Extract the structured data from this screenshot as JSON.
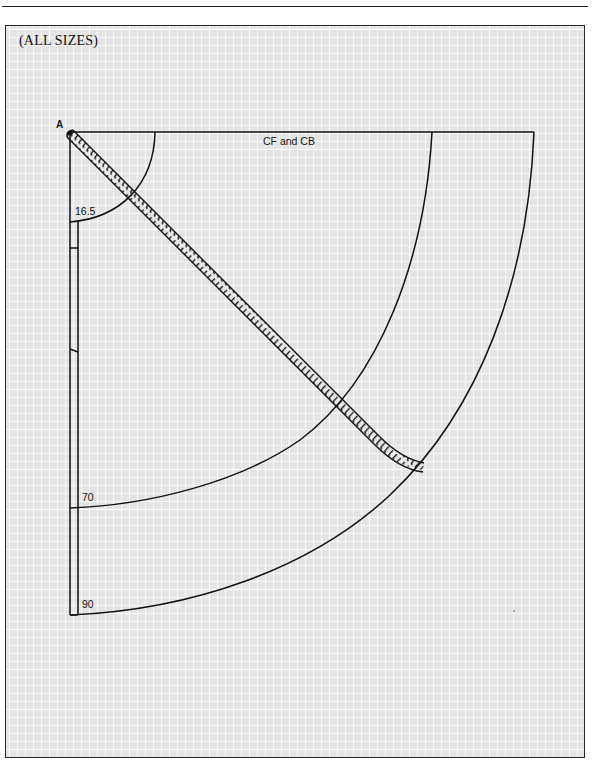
{
  "figure": {
    "caption": "(ALL SIZES)",
    "point_label": "A",
    "edge_label": "CF and CB",
    "measurements": {
      "inner_radius_label": "16.5",
      "middle_radius_label": "70",
      "outer_radius_label": "90"
    },
    "elements": {
      "tape_measure": "tape-measure",
      "grid": "graph-paper-grid"
    },
    "colors": {
      "line": "#111111",
      "grid_background": "#e4e4e4",
      "grid_lines": "#ffffff",
      "frame": "#2a2a2a"
    }
  }
}
